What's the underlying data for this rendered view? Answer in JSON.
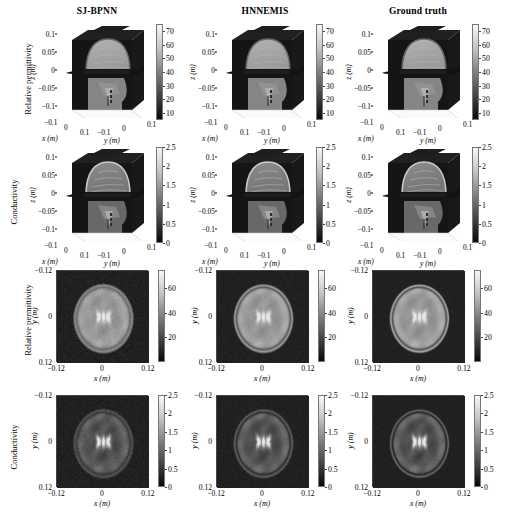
{
  "figure": {
    "width": 512,
    "height": 526,
    "columns": [
      "SJ-BPNN",
      "HNNEMIS",
      "Ground truth"
    ],
    "rows": [
      {
        "id": "row-3d-permittivity",
        "label": "Relative permittivity",
        "kind": "3d"
      },
      {
        "id": "row-3d-conductivity",
        "label": "Conductivity",
        "kind": "3d"
      },
      {
        "id": "row-2d-permittivity",
        "label": "Relative permittivity",
        "kind": "2d"
      },
      {
        "id": "row-2d-conductivity",
        "label": "Conductivity",
        "kind": "2d"
      }
    ]
  },
  "axes3d": {
    "z_label": "z (m)",
    "x_label": "x (m)",
    "y_label": "y (m)",
    "z_ticks": [
      "0.1",
      "0.05",
      "0",
      "−0.05",
      "−0.1"
    ],
    "x_ticks": [
      "−0.1",
      "0",
      "0.1"
    ],
    "y_ticks": [
      "−0.1",
      "0",
      "0.1"
    ]
  },
  "axes2d": {
    "y_label": "y (m)",
    "x_label": "x (m)",
    "y_ticks": [
      "−0.12",
      "0",
      "0.12"
    ],
    "x_ticks": [
      "−0.12",
      "0",
      "0.12"
    ]
  },
  "colorbars": {
    "permittivity_3d": {
      "ticks": [
        "70",
        "60",
        "50",
        "40",
        "30",
        "20",
        "10"
      ],
      "min": 5,
      "max": 75,
      "unit": ""
    },
    "conductivity_3d": {
      "ticks": [
        "2.5",
        "2",
        "1.5",
        "1",
        "0.5",
        "0"
      ],
      "min": 0,
      "max": 2.5,
      "unit": ""
    },
    "permittivity_2d": {
      "ticks": [
        "60",
        "40",
        "20"
      ],
      "min": 0,
      "max": 75,
      "unit": ""
    },
    "conductivity_2d": {
      "ticks": [
        "2.5",
        "2",
        "1.5",
        "1",
        "0.5",
        "0"
      ],
      "min": 0,
      "max": 2.5,
      "unit": ""
    }
  },
  "colors": {
    "colormap": "gray",
    "background_low": "#2a2a2a",
    "mid_tissue": "#8f8f8f",
    "bright_tissue": "#d8d8d8",
    "figure_background": "#ffffff",
    "text": "#000000"
  },
  "chart_data": {
    "type": "heatmap",
    "title": "",
    "subtitle": "",
    "panel_grid": {
      "rows": 4,
      "cols": 3
    },
    "quantities": [
      {
        "name": "Relative permittivity",
        "view": "3D orthogonal slice volume",
        "cmin": 5,
        "cmax": 75,
        "colorbar_ticks": [
          70,
          60,
          50,
          40,
          30,
          20,
          10
        ],
        "axis_x": {
          "label": "x (m)",
          "ticks": [
            -0.1,
            0,
            0.1
          ]
        },
        "axis_y": {
          "label": "y (m)",
          "ticks": [
            -0.1,
            0,
            0.1
          ]
        },
        "axis_z": {
          "label": "z (m)",
          "ticks": [
            -0.1,
            -0.05,
            0,
            0.05,
            0.1
          ]
        }
      },
      {
        "name": "Conductivity",
        "view": "3D orthogonal slice volume",
        "cmin": 0,
        "cmax": 2.5,
        "colorbar_ticks": [
          2.5,
          2,
          1.5,
          1,
          0.5,
          0
        ],
        "axis_x": {
          "label": "x (m)",
          "ticks": [
            -0.1,
            0,
            0.1
          ]
        },
        "axis_y": {
          "label": "y (m)",
          "ticks": [
            -0.1,
            0,
            0.1
          ]
        },
        "axis_z": {
          "label": "z (m)",
          "ticks": [
            -0.1,
            -0.05,
            0,
            0.05,
            0.1
          ]
        }
      },
      {
        "name": "Relative permittivity",
        "view": "2D axial slice",
        "cmin": 0,
        "cmax": 75,
        "colorbar_ticks": [
          60,
          40,
          20
        ],
        "axis_x": {
          "label": "x (m)",
          "ticks": [
            -0.12,
            0,
            0.12
          ]
        },
        "axis_y": {
          "label": "y (m)",
          "ticks": [
            -0.12,
            0,
            0.12
          ]
        }
      },
      {
        "name": "Conductivity",
        "view": "2D axial slice",
        "cmin": 0,
        "cmax": 2.5,
        "colorbar_ticks": [
          2.5,
          2,
          1.5,
          1,
          0.5,
          0
        ],
        "axis_x": {
          "label": "x (m)",
          "ticks": [
            -0.12,
            0,
            0.12
          ]
        },
        "axis_y": {
          "label": "y (m)",
          "ticks": [
            -0.12,
            0,
            0.12
          ]
        }
      }
    ],
    "methods": [
      "SJ-BPNN",
      "HNNEMIS",
      "Ground truth"
    ],
    "legend": "none",
    "grid": false
  }
}
